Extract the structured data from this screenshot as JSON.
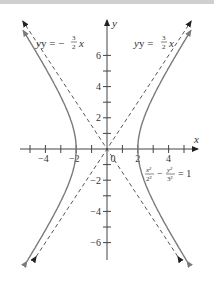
{
  "chart_data": {
    "type": "diagram",
    "equation": {
      "lhs_num1": "x²",
      "lhs_den1": "2²",
      "minus": "−",
      "lhs_num2": "y²",
      "lhs_den2": "3²",
      "rhs": "= 1"
    },
    "a": 2,
    "b": 3,
    "asymptotes": [
      {
        "label_prefix": "y = −",
        "num": "3",
        "den": "2",
        "var": "x",
        "slope": -1.5
      },
      {
        "label_prefix": "y = ",
        "num": "3",
        "den": "2",
        "var": "x",
        "slope": 1.5
      }
    ],
    "x_axis": {
      "label": "x",
      "tick_labels": [
        "−4",
        "−2",
        "0",
        "2",
        "4"
      ],
      "tick_values": [
        -4,
        -2,
        0,
        2,
        4
      ],
      "minor_ticks": [
        -5,
        -4,
        -3,
        -2,
        -1,
        1,
        2,
        3,
        4,
        5
      ]
    },
    "y_axis": {
      "label": "y",
      "tick_labels": [
        "6",
        "4",
        "2",
        "−2",
        "−4",
        "−6"
      ],
      "tick_values": [
        6,
        4,
        2,
        -2,
        -4,
        -6
      ],
      "minor_ticks": [
        -6,
        -5,
        -4,
        -3,
        -2,
        -1,
        1,
        2,
        3,
        4,
        5,
        6
      ]
    },
    "colors": {
      "curve": "#7a7a7a",
      "asymptote": "#444444",
      "axis": "#444444"
    }
  }
}
